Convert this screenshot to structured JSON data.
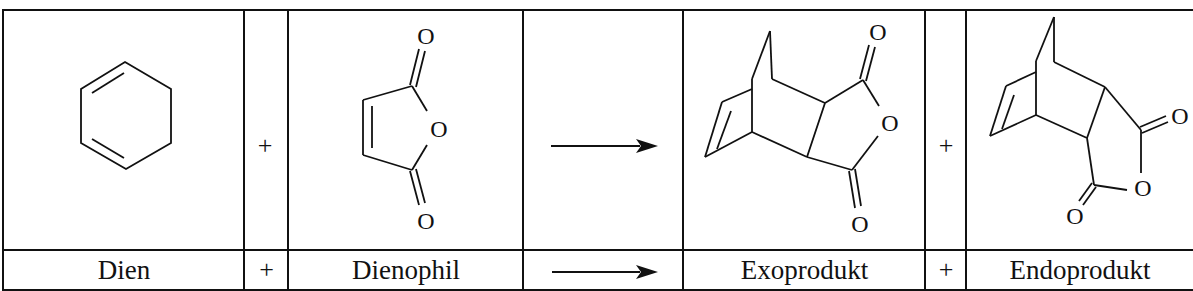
{
  "diagram": {
    "columns": [
      {
        "id": "dien",
        "label": "Dien",
        "structure": "1,3-cyclohexadiene"
      },
      {
        "id": "plus1",
        "label": "+"
      },
      {
        "id": "dienophil",
        "label": "Dienophil",
        "structure": "maleic anhydride"
      },
      {
        "id": "arrow",
        "label": "→"
      },
      {
        "id": "exo",
        "label": "Exoprodukt",
        "structure": "exo bicyclo[2.2.2]octene dicarboxylic anhydride"
      },
      {
        "id": "plus2",
        "label": "+"
      },
      {
        "id": "endo",
        "label": "Endoprodukt",
        "structure": "endo bicyclo[2.2.2]octene dicarboxylic anhydride"
      }
    ],
    "atom_labels": {
      "oxygen": "O"
    },
    "row_plus": "+",
    "colors": {
      "line": "#111111",
      "background": "#ffffff"
    }
  }
}
